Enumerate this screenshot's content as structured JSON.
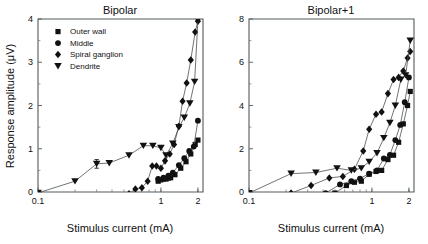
{
  "figure": {
    "background_color": "#ffffff",
    "marker_color": "#111111",
    "line_color": "#4c5052",
    "axis_color": "#555a5c"
  },
  "axis": {
    "xlabel": "Stimulus current (mA)",
    "ylabel": "Response amplitude (μV)",
    "x_tick_labels": [
      "0.1",
      "1",
      "2"
    ],
    "x_tick_values": [
      0.1,
      1,
      2
    ]
  },
  "legend": {
    "position": "top-left-of-left-panel",
    "items": [
      {
        "label": "Outer wall",
        "marker": "square"
      },
      {
        "label": "Middle",
        "marker": "circle"
      },
      {
        "label": "Spiral ganglion",
        "marker": "diamond"
      },
      {
        "label": "Dendrite",
        "marker": "triangle-down"
      }
    ]
  },
  "chart_data": [
    {
      "type": "scatter",
      "title": "Bipolar",
      "xlabel": "Stimulus current (mA)",
      "ylabel": "Response amplitude (μV)",
      "xscale": "log",
      "xlim": [
        0.1,
        2.2
      ],
      "ylim": [
        0,
        4
      ],
      "x_ticks": [
        0.1,
        1,
        2
      ],
      "x_tick_labels": [
        "0.1",
        "1",
        "2"
      ],
      "y_ticks": [
        0,
        1,
        2,
        3,
        4
      ],
      "y_tick_labels": [
        "0",
        "1",
        "2",
        "3",
        "4"
      ],
      "grid": false,
      "legend": true,
      "legend_position": "upper left",
      "series": [
        {
          "name": "Outer wall",
          "marker": "square",
          "x": [
            0.95,
            1.0,
            1.05,
            1.1,
            1.15,
            1.2,
            1.3,
            1.45,
            1.6,
            1.75,
            1.9,
            2.0
          ],
          "y": [
            0.25,
            0.28,
            0.3,
            0.3,
            0.32,
            0.33,
            0.4,
            0.55,
            0.7,
            0.88,
            1.1,
            1.2
          ]
        },
        {
          "name": "Middle",
          "marker": "circle",
          "x": [
            0.95,
            1.05,
            1.15,
            1.25,
            1.4,
            1.55,
            1.7,
            1.85,
            2.0
          ],
          "y": [
            0.3,
            0.33,
            0.38,
            0.45,
            0.62,
            0.78,
            0.95,
            1.05,
            1.65
          ]
        },
        {
          "name": "Spiral ganglion",
          "marker": "diamond",
          "x": [
            0.55,
            0.62,
            0.7,
            0.78,
            0.85,
            0.92,
            1.0,
            1.08,
            1.18,
            1.28,
            1.4,
            1.5,
            1.62,
            1.75,
            1.9,
            2.0
          ],
          "y": [
            -0.04,
            0.07,
            0.1,
            0.25,
            0.6,
            0.6,
            0.55,
            0.72,
            0.88,
            1.1,
            1.52,
            2.1,
            2.52,
            3.05,
            3.7,
            3.95
          ]
        },
        {
          "name": "Dendrite",
          "marker": "triangle-down",
          "x": [
            0.1,
            0.2,
            0.3,
            0.38,
            0.55,
            0.72,
            0.86,
            1.0,
            1.1,
            1.25,
            1.4,
            1.55,
            1.72,
            1.88,
            2.0
          ],
          "y": [
            -0.02,
            0.25,
            0.65,
            0.67,
            0.85,
            1.07,
            1.07,
            1.02,
            0.85,
            1.12,
            1.5,
            1.72,
            2.05,
            2.55,
            3.98
          ],
          "errorbars": [
            {
              "x": 0.3,
              "y": 0.65,
              "yerr": 0.1
            }
          ]
        }
      ]
    },
    {
      "type": "scatter",
      "title": "Bipolar+1",
      "xlabel": "Stimulus current (mA)",
      "ylabel": "Response amplitude (μV)",
      "xscale": "log",
      "xlim": [
        0.1,
        2.2
      ],
      "ylim": [
        0,
        8
      ],
      "x_ticks": [
        0.1,
        1,
        2
      ],
      "x_tick_labels": [
        "0.1",
        "1",
        "2"
      ],
      "y_ticks": [
        0,
        2,
        4,
        6,
        8
      ],
      "y_tick_labels": [
        "0",
        "2",
        "4",
        "6",
        "8"
      ],
      "grid": false,
      "legend": false,
      "series": [
        {
          "name": "Outer wall",
          "marker": "square",
          "x": [
            0.5,
            0.62,
            0.72,
            0.82,
            0.95,
            1.08,
            1.2,
            1.35,
            1.5,
            1.65,
            1.8,
            1.95,
            2.05
          ],
          "y": [
            -0.05,
            0.3,
            0.45,
            0.5,
            0.82,
            0.95,
            1.0,
            1.5,
            1.7,
            2.3,
            3.15,
            4.0,
            4.65
          ]
        },
        {
          "name": "Middle",
          "marker": "circle",
          "x": [
            0.42,
            0.55,
            0.68,
            0.8,
            0.95,
            1.1,
            1.25,
            1.4,
            1.55,
            1.7,
            1.85,
            2.0
          ],
          "y": [
            -0.05,
            0.35,
            0.5,
            0.62,
            0.85,
            1.0,
            1.55,
            1.72,
            2.4,
            3.1,
            4.15,
            5.3
          ]
        },
        {
          "name": "Spiral ganglion",
          "marker": "diamond",
          "x": [
            0.22,
            0.32,
            0.45,
            0.58,
            0.72,
            0.85,
            0.95,
            1.08,
            1.2,
            1.35,
            1.5,
            1.65,
            1.8,
            1.95,
            2.05
          ],
          "y": [
            -0.05,
            0.3,
            0.65,
            0.72,
            1.05,
            1.9,
            2.9,
            3.6,
            3.7,
            4.55,
            5.2,
            5.3,
            5.6,
            6.2,
            6.5
          ]
        },
        {
          "name": "Dendrite",
          "marker": "triangle-down",
          "x": [
            0.1,
            0.22,
            0.35,
            0.52,
            0.68,
            0.82,
            0.95,
            1.1,
            1.25,
            1.4,
            1.55,
            1.72,
            1.88,
            2.05
          ],
          "y": [
            -0.05,
            0.85,
            0.9,
            1.1,
            1.0,
            1.1,
            1.4,
            1.8,
            2.5,
            3.2,
            4.0,
            5.2,
            5.4,
            7.0
          ]
        }
      ]
    }
  ]
}
